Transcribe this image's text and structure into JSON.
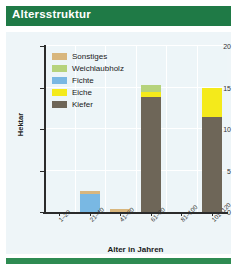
{
  "header": {
    "title": "Altersstruktur"
  },
  "chart_data": {
    "type": "bar",
    "title": "Altersstruktur",
    "xlabel": "Alter in Jahren",
    "ylabel": "Hektar",
    "ylim": [
      0,
      20
    ],
    "yticks": [
      0,
      5,
      10,
      15,
      20
    ],
    "ytick_labels": [
      "0",
      "5",
      "10",
      "15",
      "20"
    ],
    "grid": true,
    "stacked": true,
    "legend_position": "top-left-inside",
    "categories": [
      "1–20",
      "21–40",
      "41–60",
      "61–80",
      "81–100",
      "101–120"
    ],
    "series": [
      {
        "name": "Sonstiges",
        "color": "#d8b67d",
        "values": [
          0,
          0.35,
          0.4,
          0,
          0,
          0
        ]
      },
      {
        "name": "Weichlaubholz",
        "color": "#b6d37c",
        "values": [
          0,
          0,
          0,
          0.9,
          0,
          0
        ]
      },
      {
        "name": "Fichte",
        "color": "#79b8e3",
        "values": [
          0,
          2.15,
          0,
          0,
          0,
          0
        ]
      },
      {
        "name": "Eiche",
        "color": "#f4ea1b",
        "values": [
          0,
          0,
          0,
          0.55,
          0,
          3.6
        ]
      },
      {
        "name": "Kiefer",
        "color": "#6e6658",
        "values": [
          0,
          0,
          0,
          13.9,
          0,
          11.4
        ]
      }
    ],
    "stack_order": [
      "Kiefer",
      "Eiche",
      "Weichlaubholz",
      "Fichte",
      "Sonstiges"
    ],
    "totals": [
      0,
      2.5,
      0.4,
      15.35,
      0,
      15.0
    ]
  },
  "legend": {
    "items": [
      {
        "label": "Sonstiges",
        "color": "#d8b67d"
      },
      {
        "label": "Weichlaubholz",
        "color": "#b6d37c"
      },
      {
        "label": "Fichte",
        "color": "#79b8e3"
      },
      {
        "label": "Eiche",
        "color": "#f4ea1b"
      },
      {
        "label": "Kiefer",
        "color": "#6e6658"
      }
    ]
  },
  "colors": {
    "header_green": "#1f7a46",
    "footer_green": "#2e8b52",
    "plot_background": "#edf5f8",
    "axis": "#2b2b2b"
  }
}
